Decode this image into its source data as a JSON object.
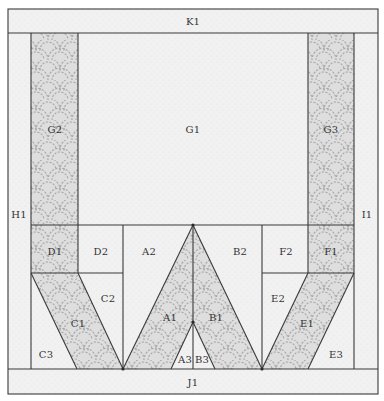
{
  "diagram": {
    "colors": {
      "background_fabric": "#f1f1f1",
      "accent_fabric": "#dedede",
      "accent_dots": "#a9a9a9",
      "line": "#3a3a3a",
      "text": "#333333"
    },
    "pieces": {
      "K1": "K1",
      "H1": "H1",
      "I1": "I1",
      "J1": "J1",
      "G1": "G1",
      "G2": "G2",
      "G3": "G3",
      "D1": "D1",
      "D2": "D2",
      "C1": "C1",
      "C2": "C2",
      "C3": "C3",
      "A1": "A1",
      "A2": "A2",
      "A3": "A3",
      "B1": "B1",
      "B2": "B2",
      "B3": "B3",
      "E1": "E1",
      "E2": "E2",
      "E3": "E3",
      "F1": "F1",
      "F2": "F2"
    },
    "accent_pieces": [
      "G2",
      "G3",
      "D1",
      "F1",
      "C1",
      "E1",
      "A1",
      "B1"
    ]
  }
}
